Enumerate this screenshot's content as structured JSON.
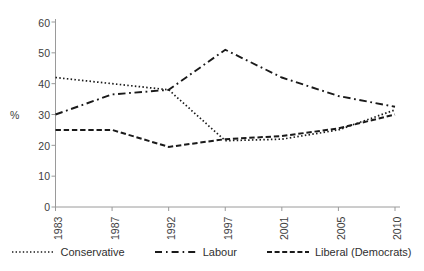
{
  "chart_data": {
    "type": "line",
    "title": "",
    "xlabel": "",
    "ylabel": "%",
    "categories": [
      "1983",
      "1987",
      "1992",
      "1997",
      "2001",
      "2005",
      "2010"
    ],
    "ylim": [
      0,
      60
    ],
    "yticks": [
      0,
      10,
      20,
      30,
      40,
      50,
      60
    ],
    "grid": false,
    "legend_position": "bottom",
    "series": [
      {
        "name": "Conservative",
        "style": "dotted",
        "color": "#1a1a1a",
        "values": [
          42,
          40,
          38,
          21.5,
          22,
          25,
          31.5
        ]
      },
      {
        "name": "Labour",
        "style": "dash-dot",
        "color": "#1a1a1a",
        "values": [
          30,
          36.5,
          38,
          51,
          42,
          36,
          32.5
        ]
      },
      {
        "name": "Liberal (Democrats)",
        "style": "dashed",
        "color": "#1a1a1a",
        "values": [
          25,
          25,
          19.5,
          22,
          23,
          25.5,
          30
        ]
      }
    ]
  },
  "axis": {
    "y_title": "%",
    "y_labels": [
      "60",
      "50",
      "40",
      "30",
      "20",
      "10",
      "0"
    ],
    "x_labels": [
      "1983",
      "1987",
      "1992",
      "1997",
      "2001",
      "2005",
      "2010"
    ]
  },
  "legend": {
    "items": [
      {
        "label": "Conservative",
        "swatch": "dotted-line-swatch"
      },
      {
        "label": "Labour",
        "swatch": "dashdot-line-swatch"
      },
      {
        "label": "Liberal (Democrats)",
        "swatch": "dashed-line-swatch"
      }
    ]
  },
  "colors": {
    "axis": "#9a9a9a",
    "line": "#1a1a1a",
    "text": "#3d3d3d"
  }
}
